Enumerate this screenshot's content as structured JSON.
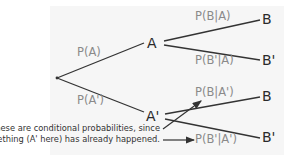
{
  "diagram": {
    "type": "probability-tree",
    "nodes": {
      "root": "",
      "a": "A",
      "a_prime": "A'",
      "b_upper": "B",
      "b_prime_upper": "B'",
      "b_lower": "B",
      "b_prime_lower": "B'"
    },
    "edges": {
      "root_to_a": "P(A)",
      "root_to_a_prime": "P(A')",
      "a_to_b": "P(B|A)",
      "a_to_b_prime": "P(B'|A)",
      "a_prime_to_b": "P(B|A')",
      "a_prime_to_b_prime": "P(B'|A')"
    },
    "annotation": {
      "line1": "These are conditional probabilities, since",
      "line2": "something (A' here) has already happened."
    },
    "colors": {
      "line": "#333333",
      "edge_label": "#8a8a8a",
      "node_label": "#2a2a2a",
      "panel": "#f6f6f6"
    }
  }
}
